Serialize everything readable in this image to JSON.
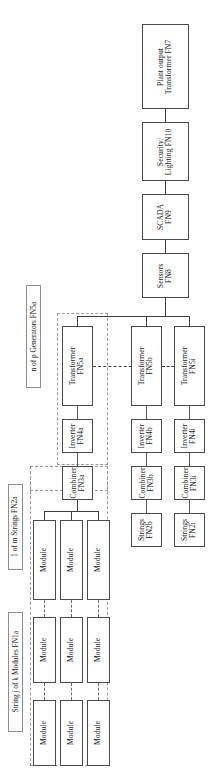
{
  "diagram": {
    "orientation": "rotated-90-ccw",
    "colors": {
      "box_border": "#4a4a4a",
      "line": "#3d3d3d",
      "group_border": "#9b9b9b",
      "background": "#ffffff"
    }
  },
  "nodes": {
    "plant_output_transformer": {
      "line1": "Plant output",
      "line2": "Transformer FN7"
    },
    "security_lighting": {
      "line1": "Security/",
      "line2": "Lighting FN10"
    },
    "scada": {
      "line1": "SCADA",
      "line2": "FN9"
    },
    "sensors": {
      "line1": "Sensors",
      "line2": "FN8"
    },
    "transformer_a": {
      "line1": "Transformer",
      "line2": "FN5a"
    },
    "transformer_b": {
      "line1": "Transformer",
      "line2": "FN5b"
    },
    "transformer_i": {
      "line1": "Transformer",
      "line2": "FN5i"
    },
    "inverter_a": {
      "line1": "Inverter",
      "line2": "FN4a"
    },
    "inverter_b": {
      "line1": "Inverter",
      "line2": "FN4b"
    },
    "inverter_i": {
      "line1": "Inverter",
      "line2": "FN4i"
    },
    "combiner_a": {
      "line1": "Combiner",
      "line2": "FN3a"
    },
    "combiner_b": {
      "line1": "Combiner",
      "line2": "FN3b"
    },
    "combiner_i": {
      "line1": "Combiner",
      "line2": "FN3i"
    },
    "strings_b": {
      "line1": "Strings",
      "line2": "FN2b"
    },
    "strings_i": {
      "line1": "Strings",
      "line2": "FN2i"
    },
    "module": {
      "line1": "Module",
      "line2": ""
    }
  },
  "modules": [
    {
      "id": "module-r1c1",
      "label": "Module"
    },
    {
      "id": "module-r1c2",
      "label": "Module"
    },
    {
      "id": "module-r1c3",
      "label": "Module"
    },
    {
      "id": "module-r2c1",
      "label": "Module"
    },
    {
      "id": "module-r2c2",
      "label": "Module"
    },
    {
      "id": "module-r2c3",
      "label": "Module"
    },
    {
      "id": "module-r3c1",
      "label": "Module"
    },
    {
      "id": "module-r3c2",
      "label": "Module"
    },
    {
      "id": "module-r3c3",
      "label": "Module"
    }
  ],
  "captions": {
    "generators": "n of p Generators FN5a",
    "strings": "1 of m Strings FN2a",
    "modules": "String j of k Modules FN1a"
  }
}
